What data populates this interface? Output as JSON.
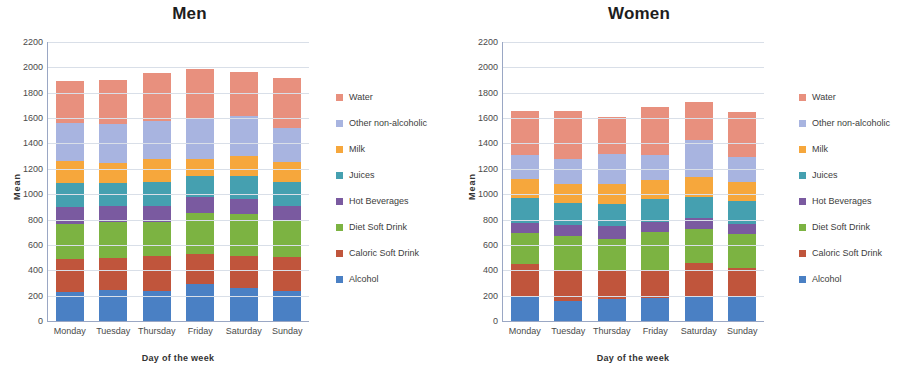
{
  "figure": {
    "background": "#ffffff"
  },
  "series_colors": {
    "Water": "#e8907e",
    "Other non-alcoholic": "#a8b4e0",
    "Milk": "#f6a73c",
    "Juices": "#45a0b0",
    "Hot Beverages": "#7a5aa0",
    "Diet Soft Drink": "#7cb342",
    "Caloric Soft Drink": "#c0553c",
    "Alcohol": "#4a80c4"
  },
  "charts": [
    {
      "id": "men",
      "title": "Men",
      "xlabel": "Day of the week",
      "ylabel": "Mean",
      "ylim": [
        0,
        2200
      ],
      "yticks": [
        0,
        200,
        400,
        600,
        800,
        1000,
        1200,
        1400,
        1600,
        1800,
        2000,
        2200
      ],
      "legend_position": "right"
    },
    {
      "id": "women",
      "title": "Women",
      "xlabel": "Day of the week",
      "ylabel": "Mean",
      "ylim": [
        0,
        2200
      ],
      "yticks": [
        0,
        200,
        400,
        600,
        800,
        1000,
        1200,
        1400,
        1600,
        1800,
        2000,
        2200
      ],
      "legend_position": "right"
    }
  ],
  "legend_items": [
    "Water",
    "Other non-alcoholic",
    "Milk",
    "Juices",
    "Hot Beverages",
    "Diet Soft Drink",
    "Caloric Soft Drink",
    "Alcohol"
  ],
  "chart_data": [
    {
      "type": "bar",
      "stacked": true,
      "id": "men",
      "title": "Men",
      "xlabel": "Day of the week",
      "ylabel": "Mean",
      "ylim": [
        0,
        2200
      ],
      "yticks": [
        0,
        200,
        400,
        600,
        800,
        1000,
        1200,
        1400,
        1600,
        1800,
        2000,
        2200
      ],
      "grid": "horizontal",
      "legend": "right",
      "categories": [
        "Monday",
        "Tuesday",
        "Thursday",
        "Friday",
        "Saturday",
        "Sunday"
      ],
      "series": [
        {
          "name": "Alcohol",
          "values": [
            230,
            245,
            240,
            290,
            260,
            235
          ]
        },
        {
          "name": "Caloric Soft Drink",
          "values": [
            260,
            250,
            270,
            240,
            250,
            270
          ]
        },
        {
          "name": "Diet Soft Drink",
          "values": [
            275,
            285,
            270,
            320,
            330,
            280
          ]
        },
        {
          "name": "Hot Beverages",
          "values": [
            135,
            125,
            130,
            125,
            125,
            120
          ]
        },
        {
          "name": "Juices",
          "values": [
            190,
            180,
            185,
            170,
            175,
            190
          ]
        },
        {
          "name": "Milk",
          "values": [
            170,
            160,
            180,
            130,
            160,
            160
          ]
        },
        {
          "name": "Other non-alcoholic",
          "values": [
            300,
            305,
            300,
            315,
            315,
            270
          ]
        },
        {
          "name": "Water",
          "values": [
            330,
            350,
            380,
            400,
            345,
            390
          ]
        }
      ],
      "totals": [
        1890,
        1900,
        1955,
        1990,
        1960,
        1915
      ]
    },
    {
      "type": "bar",
      "stacked": true,
      "id": "women",
      "title": "Women",
      "xlabel": "Day of the week",
      "ylabel": "Mean",
      "ylim": [
        0,
        2200
      ],
      "yticks": [
        0,
        200,
        400,
        600,
        800,
        1000,
        1200,
        1400,
        1600,
        1800,
        2000,
        2200
      ],
      "grid": "horizontal",
      "legend": "right",
      "categories": [
        "Monday",
        "Tuesday",
        "Thursday",
        "Friday",
        "Saturday",
        "Sunday"
      ],
      "series": [
        {
          "name": "Alcohol",
          "values": [
            195,
            160,
            175,
            180,
            190,
            195
          ]
        },
        {
          "name": "Caloric Soft Drink",
          "values": [
            255,
            235,
            230,
            220,
            270,
            225
          ]
        },
        {
          "name": "Diet Soft Drink",
          "values": [
            245,
            275,
            245,
            300,
            265,
            265
          ]
        },
        {
          "name": "Hot Beverages",
          "values": [
            80,
            85,
            100,
            80,
            90,
            80
          ]
        },
        {
          "name": "Juices",
          "values": [
            195,
            175,
            175,
            185,
            165,
            180
          ]
        },
        {
          "name": "Milk",
          "values": [
            150,
            150,
            155,
            145,
            155,
            155
          ]
        },
        {
          "name": "Other non-alcoholic",
          "values": [
            190,
            200,
            240,
            200,
            290,
            195
          ]
        },
        {
          "name": "Water",
          "values": [
            345,
            375,
            290,
            380,
            305,
            355
          ]
        }
      ],
      "totals": [
        1655,
        1655,
        1610,
        1690,
        1730,
        1650
      ]
    }
  ]
}
